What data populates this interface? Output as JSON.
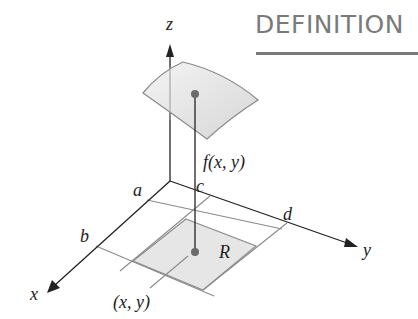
{
  "title": "DEFINITION",
  "diagram": {
    "axes": {
      "x": "x",
      "y": "y",
      "z": "z"
    },
    "interval_labels": {
      "a": "a",
      "b": "b",
      "c": "c",
      "d": "d"
    },
    "region_label": "R",
    "function_label": "f(x, y)",
    "point_label": "(x, y)",
    "colors": {
      "title": "#7a7a7a",
      "axis": "#222222",
      "grid": "#8a8a8a",
      "region_fill": "#e6e6e6",
      "surface_fill": "#e4e4e4",
      "point": "#666666"
    }
  }
}
